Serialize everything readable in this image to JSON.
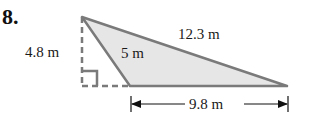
{
  "problem_number": "8.",
  "figure": {
    "type": "obtuse triangle with dashed altitude",
    "fill_color": "#e6e6e6",
    "stroke_color": "#7a7a7a",
    "labels": {
      "height": "4.8 m",
      "short_side": "5 m",
      "long_side": "12.3 m",
      "base": "9.8 m"
    }
  }
}
